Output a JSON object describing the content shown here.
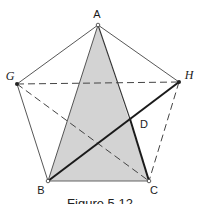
{
  "figure": {
    "caption": "Figure 5.12",
    "colors": {
      "fill": "#d3d3d3",
      "line": "#333333",
      "thick": "#1a1a1a",
      "background": "#ffffff"
    },
    "points": {
      "A": {
        "label": "A",
        "x": 98,
        "y": 25
      },
      "G": {
        "label": "G",
        "x": 17,
        "y": 84
      },
      "H": {
        "label": "H",
        "x": 179,
        "y": 82
      },
      "B": {
        "label": "B",
        "x": 48,
        "y": 181
      },
      "C": {
        "label": "C",
        "x": 149,
        "y": 181
      },
      "D": {
        "label": "D",
        "x": 130,
        "y": 119
      }
    },
    "shaded_region": [
      "A",
      "B",
      "C"
    ],
    "segments": {
      "solid_thin": [
        [
          "A",
          "G"
        ],
        [
          "A",
          "H"
        ],
        [
          "G",
          "B"
        ],
        [
          "B",
          "C"
        ],
        [
          "A",
          "B"
        ],
        [
          "A",
          "D"
        ]
      ],
      "solid_thick": [
        [
          "B",
          "H"
        ],
        [
          "D",
          "C"
        ]
      ],
      "dashed": [
        [
          "G",
          "H"
        ],
        [
          "G",
          "C"
        ],
        [
          "H",
          "C"
        ]
      ]
    }
  }
}
